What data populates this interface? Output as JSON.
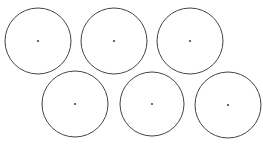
{
  "diagram": {
    "background": "#ffffff",
    "stroke_color": "#444444",
    "dot_color": "#222222",
    "circles": [
      {
        "cx": 38,
        "cy": 41,
        "r": 33
      },
      {
        "cx": 114,
        "cy": 41,
        "r": 33
      },
      {
        "cx": 190,
        "cy": 41,
        "r": 33
      },
      {
        "cx": 75,
        "cy": 104,
        "r": 33
      },
      {
        "cx": 152,
        "cy": 104,
        "r": 32
      },
      {
        "cx": 228,
        "cy": 105,
        "r": 33
      }
    ]
  }
}
